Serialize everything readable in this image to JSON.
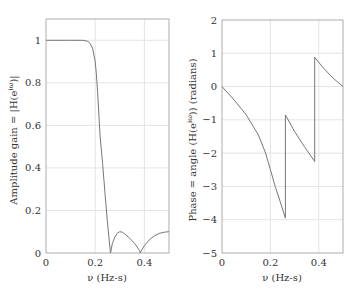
{
  "chart_data": [
    {
      "type": "line",
      "title": "",
      "xlabel": "ν (Hz-s)",
      "ylabel": "Amplitude gain = |H(e^{iω})|",
      "xlim": [
        0,
        0.5
      ],
      "ylim": [
        0,
        1.1
      ],
      "xticks": [
        "0",
        "0.2",
        "0.4"
      ],
      "yticks": [
        "0",
        "0.2",
        "0.4",
        "0.6",
        "0.8",
        "1"
      ],
      "grid": true,
      "series": [
        {
          "name": "amplitude",
          "x": [
            0,
            0.1,
            0.15,
            0.17,
            0.18,
            0.19,
            0.2,
            0.205,
            0.21,
            0.215,
            0.22,
            0.23,
            0.24,
            0.25,
            0.262,
            0.27,
            0.28,
            0.29,
            0.3,
            0.31,
            0.32,
            0.34,
            0.36,
            0.38,
            0.383,
            0.39,
            0.4,
            0.42,
            0.44,
            0.46,
            0.48,
            0.5
          ],
          "values": [
            1,
            1,
            1,
            0.995,
            0.985,
            0.96,
            0.9,
            0.84,
            0.75,
            0.65,
            0.55,
            0.42,
            0.28,
            0.14,
            0,
            0.045,
            0.075,
            0.093,
            0.1,
            0.098,
            0.09,
            0.07,
            0.045,
            0.012,
            0,
            0.015,
            0.035,
            0.062,
            0.08,
            0.092,
            0.098,
            0.1
          ]
        }
      ]
    },
    {
      "type": "line",
      "title": "",
      "xlabel": "ν (Hz-s)",
      "ylabel": "Phase = angle (H(e^{iω})) (radians)",
      "xlim": [
        0,
        0.5
      ],
      "ylim": [
        -5,
        2
      ],
      "xticks": [
        "0",
        "0.2",
        "0.4"
      ],
      "yticks": [
        "-5",
        "-4",
        "-3",
        "-2",
        "-1",
        "0",
        "1",
        "2"
      ],
      "grid": true,
      "series": [
        {
          "name": "phase",
          "x": [
            0,
            0.05,
            0.1,
            0.15,
            0.18,
            0.2,
            0.22,
            0.24,
            0.262,
            0.262,
            0.3,
            0.34,
            0.383,
            0.383,
            0.42,
            0.46,
            0.5
          ],
          "values": [
            0,
            -0.4,
            -0.85,
            -1.45,
            -2.0,
            -2.5,
            -3.0,
            -3.45,
            -3.95,
            -0.85,
            -1.35,
            -1.8,
            -2.25,
            0.88,
            0.55,
            0.25,
            0
          ]
        }
      ]
    }
  ],
  "labels": {
    "left_xlabel": "ν (Hz-s)",
    "left_ylabel": "Amplitude gain = |H(e",
    "left_ylabel_sup": "iω",
    "left_ylabel_end": ")|",
    "right_xlabel": "ν (Hz-s)",
    "right_ylabel": "Phase = angle (H(e",
    "right_ylabel_sup": "iω",
    "right_ylabel_end": ")) (radians)"
  }
}
